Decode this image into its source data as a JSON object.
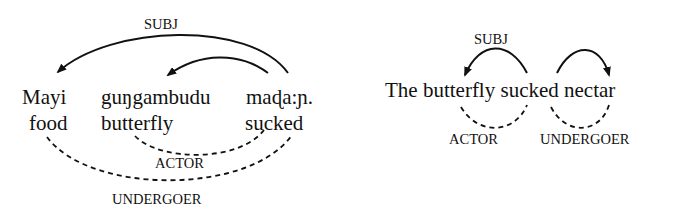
{
  "left_diagram": {
    "words": [
      {
        "form": "Mayi",
        "gloss": "food"
      },
      {
        "form": "guŋgambudu",
        "gloss": "butterfly"
      },
      {
        "form": "maɖa:ɲ.",
        "gloss": "sucked"
      }
    ],
    "labels": {
      "subj": "SUBJ",
      "actor": "ACTOR",
      "undergoer": "UNDERGOER"
    }
  },
  "right_diagram": {
    "sentence": "The butterfly sucked nectar",
    "labels": {
      "subj": "SUBJ",
      "actor": "ACTOR",
      "undergoer": "UNDERGOER"
    }
  },
  "colors": {
    "ink": "#111111",
    "background": "#ffffff"
  }
}
